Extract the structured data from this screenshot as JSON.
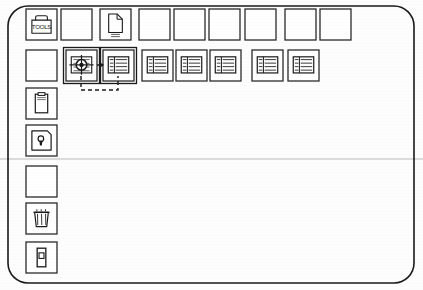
{
  "canvas": {
    "width": 423,
    "height": 290,
    "background": "#fdfdfd"
  },
  "frame": {
    "name": "outer-rounded-frame",
    "x": 8,
    "y": 6,
    "width": 406,
    "height": 277,
    "radius": 20,
    "stroke": "#1a1a1a",
    "stroke_width": 1.6,
    "fill": "none"
  },
  "divider": {
    "name": "horizontal-divider",
    "x1": 0,
    "y1": 159,
    "x2": 423,
    "y2": 159,
    "stroke": "#b9b9b9",
    "stroke_width": 1
  },
  "colors": {
    "ink": "#1a1a1a",
    "ink_light": "#3a3a3a",
    "box_stroke": "#2b2b2b",
    "faint": "#b9b9b9",
    "paper": "#fdfdfd"
  },
  "box_style": {
    "size": 31,
    "stroke": "#2b2b2b",
    "stroke_width": 1.3,
    "fill": "#ffffff"
  },
  "rows": [
    {
      "name": "row-top",
      "y": 9,
      "boxes": [
        {
          "name": "box-toolbox",
          "x": 26,
          "icon": "toolbox-icon",
          "label": "TOOLS",
          "selected": false
        },
        {
          "name": "box-empty-1",
          "x": 61,
          "icon": "empty-icon",
          "label": "",
          "selected": false
        },
        {
          "name": "box-document",
          "x": 100,
          "icon": "document-icon",
          "label": "",
          "selected": false
        },
        {
          "name": "box-empty-2",
          "x": 139,
          "icon": "empty-icon",
          "label": "",
          "selected": false
        },
        {
          "name": "box-empty-3",
          "x": 174,
          "icon": "empty-icon",
          "label": "",
          "selected": false
        },
        {
          "name": "box-empty-4",
          "x": 209,
          "icon": "empty-icon",
          "label": "",
          "selected": false
        },
        {
          "name": "box-empty-5",
          "x": 245,
          "icon": "empty-icon",
          "label": "",
          "selected": false
        },
        {
          "name": "box-empty-6",
          "x": 285,
          "icon": "empty-icon",
          "label": "",
          "selected": false
        },
        {
          "name": "box-empty-7",
          "x": 320,
          "icon": "empty-icon",
          "label": "",
          "selected": false
        }
      ]
    },
    {
      "name": "row-second",
      "y": 50,
      "boxes": [
        {
          "name": "box-empty-8",
          "x": 26,
          "icon": "empty-icon",
          "label": "",
          "selected": false
        },
        {
          "name": "box-target",
          "x": 66,
          "icon": "crosshair-icon",
          "label": "",
          "selected": true
        },
        {
          "name": "box-list-1",
          "x": 103,
          "icon": "list-split-icon",
          "label": "",
          "selected": true
        },
        {
          "name": "box-list-2",
          "x": 142,
          "icon": "list-icon",
          "label": "",
          "selected": false
        },
        {
          "name": "box-list-3",
          "x": 176,
          "icon": "list-icon",
          "label": "",
          "selected": false
        },
        {
          "name": "box-list-4",
          "x": 210,
          "icon": "list-icon",
          "label": "",
          "selected": false
        },
        {
          "name": "box-list-5",
          "x": 252,
          "icon": "list-icon",
          "label": "",
          "selected": false
        },
        {
          "name": "box-list-6",
          "x": 288,
          "icon": "list-icon",
          "label": "",
          "selected": false
        }
      ]
    }
  ],
  "left_column": {
    "name": "left-column",
    "x": 26,
    "boxes": [
      {
        "name": "box-clipboard",
        "y": 88,
        "icon": "clipboard-icon"
      },
      {
        "name": "box-keyhole",
        "y": 125,
        "icon": "keyhole-icon"
      },
      {
        "name": "box-empty-9",
        "y": 166,
        "icon": "empty-icon"
      },
      {
        "name": "box-trash",
        "y": 203,
        "icon": "trash-icon"
      },
      {
        "name": "box-module",
        "y": 242,
        "icon": "module-icon"
      }
    ]
  },
  "connectors": {
    "name": "dashed-feedback-loop",
    "stroke": "#1a1a1a",
    "stroke_width": 1.4,
    "dash": "4 3",
    "arrow_link": {
      "name": "arrow-target-to-list",
      "from_x": 97,
      "to_x": 103,
      "y": 65
    },
    "loop": {
      "name": "loop-path",
      "down_left_x": 81,
      "down_right_x": 118,
      "top_y": 76,
      "bottom_y": 90
    }
  },
  "icons": {
    "toolbox-icon": {
      "glyph": "toolbox",
      "description": "tool box with handle and TOOLS text"
    },
    "document-icon": {
      "glyph": "page",
      "description": "page with folded corner"
    },
    "crosshair-icon": {
      "glyph": "target",
      "description": "target crosshair over ruled page"
    },
    "list-icon": {
      "glyph": "list",
      "description": "page with bullet list rows"
    },
    "list-split-icon": {
      "glyph": "list-split",
      "description": "page with divided list rows"
    },
    "clipboard-icon": {
      "glyph": "clipboard",
      "description": "clipboard / form sheet"
    },
    "keyhole-icon": {
      "glyph": "keyhole",
      "description": "keyhole lock symbol"
    },
    "trash-icon": {
      "glyph": "trash",
      "description": "waste basket"
    },
    "module-icon": {
      "glyph": "module",
      "description": "small vertical module / cartridge"
    },
    "empty-icon": {
      "glyph": "empty",
      "description": "blank box"
    }
  }
}
